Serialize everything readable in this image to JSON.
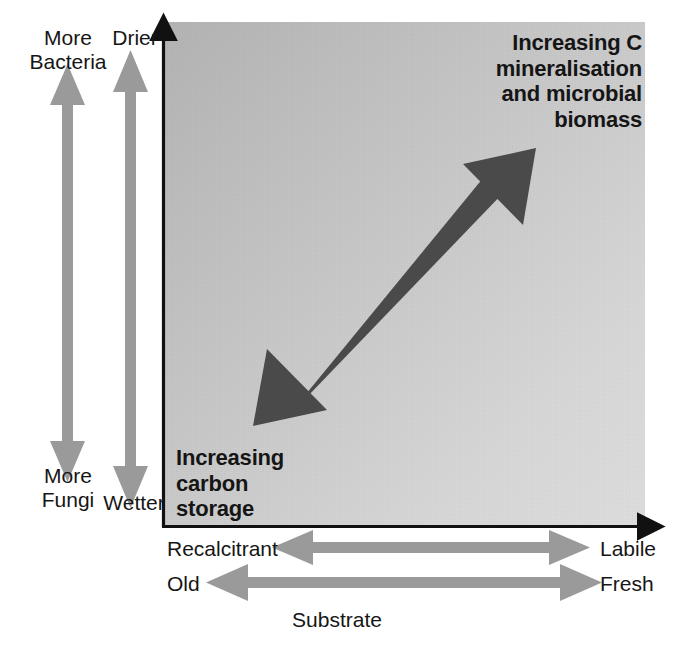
{
  "figure": {
    "name": "soil-substrate-microbial-conceptual-diagram",
    "background_color": "#ffffff"
  },
  "panel": {
    "gradient_from": "#b4b4b4",
    "gradient_to": "#dedede",
    "axis_color": "#111111"
  },
  "y_axis": {
    "left_scale": {
      "name": "microbial-community-scale",
      "top_label": "More\nBacteria",
      "bottom_label": "More\nFungi",
      "arrow_color": "#9a9a9a"
    },
    "right_scale": {
      "name": "moisture-scale",
      "top_label": "Drier",
      "bottom_label": "Wetter",
      "arrow_color": "#9a9a9a"
    }
  },
  "x_axis": {
    "title": "Substrate",
    "scales": [
      {
        "name": "quality-scale",
        "left_label": "Recalcitrant",
        "right_label": "Labile",
        "arrow_color": "#9a9a9a"
      },
      {
        "name": "age-scale",
        "left_label": "Old",
        "right_label": "Fresh",
        "arrow_color": "#9a9a9a"
      }
    ]
  },
  "callouts": {
    "upper_right": {
      "name": "increasing-c-mineralisation",
      "text": "Increasing C\nmineralisation\nand microbial\nbiomass"
    },
    "lower_left": {
      "name": "increasing-carbon-storage",
      "text": "Increasing\ncarbon\nstorage"
    }
  },
  "diagonal_arrow": {
    "name": "gradient-trend-arrow",
    "color": "#4a4a4a",
    "double_headed": true,
    "from": [
      253,
      426
    ],
    "to": [
      536,
      148
    ]
  }
}
